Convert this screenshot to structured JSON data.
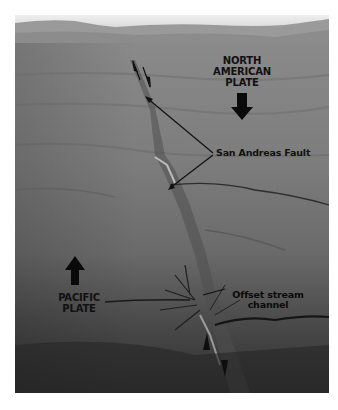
{
  "figure": {
    "labels": {
      "north_american_plate": [
        "NORTH",
        "AMERICAN",
        "PLATE"
      ],
      "pacific_plate": [
        "PACIFIC",
        "PLATE"
      ],
      "san_andreas_fault": "San Andreas Fault",
      "offset_stream": [
        "Offset stream",
        "channel"
      ]
    },
    "arrows": {
      "north_american_plate_motion": "down",
      "pacific_plate_motion": "up"
    },
    "colors": {
      "sky": "#e4e4e4",
      "mountains": "#8c8c8c",
      "plain": "#7a7a7a",
      "foreground": "#3a3a3a",
      "label_text": "#111111"
    }
  }
}
